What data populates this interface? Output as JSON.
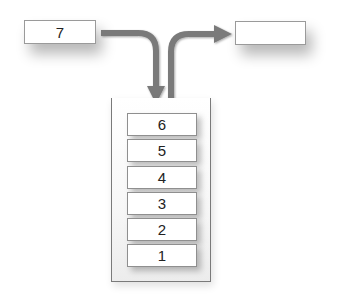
{
  "diagram": {
    "type": "stack-push-pop",
    "input_box": {
      "label": "7"
    },
    "output_box": {
      "label": ""
    },
    "arrows": [
      {
        "name": "push-arrow",
        "from": "input_box",
        "to": "stack_top"
      },
      {
        "name": "pop-arrow",
        "from": "stack_top",
        "to": "output_box"
      }
    ],
    "stack": {
      "items_top_to_bottom": [
        "6",
        "5",
        "4",
        "3",
        "2",
        "1"
      ]
    },
    "colors": {
      "arrow": "#7a7a7a",
      "box_border": "#9a9a9a",
      "box_fill": "#ffffff"
    }
  }
}
